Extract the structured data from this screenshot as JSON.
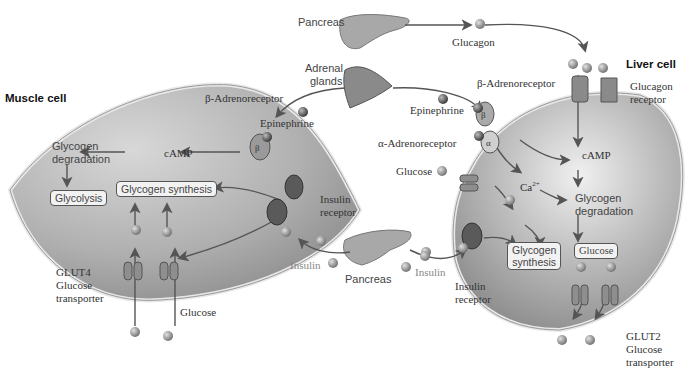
{
  "diagram": {
    "colors": {
      "cell_fill": "#9c9c9c",
      "cell_highlight": "#e6e6e6",
      "membrane": "#dcdcdc",
      "arrow": "#555555",
      "receptor_dark": "#5a5a5a",
      "molecule": "#8a8a8a",
      "transporter": "#8e8e8e"
    },
    "organs": {
      "pancreas_top": "Pancreas",
      "adrenal": "Adrenal glands",
      "pancreas_bottom": "Pancreas"
    },
    "hormones": {
      "glucagon": "Glucagon",
      "epinephrine_left": "Epinephrine",
      "epinephrine_right": "Epinephrine",
      "insulin_left": "Insulin",
      "insulin_right": "Insulin"
    },
    "muscle_cell": {
      "title": "Muscle cell",
      "beta_receptor_label": "β-Adrenoreceptor",
      "beta_symbol": "β",
      "camp": "cAMP",
      "glycogen_degradation_1": "Glycogen",
      "glycogen_degradation_2": "degradation",
      "glycolysis": "Glycolysis",
      "glycogen_synthesis": "Glycogen synthesis",
      "insulin_receptor_1": "Insulin",
      "insulin_receptor_2": "receptor",
      "glut4_1": "GLUT4",
      "glut4_2": "Glucose",
      "glut4_3": "transporter",
      "glucose": "Glucose"
    },
    "liver_cell": {
      "title": "Liver cell",
      "glucagon_receptor_1": "Glucagon",
      "glucagon_receptor_2": "receptor",
      "beta_receptor_label": "β-Adrenoreceptor",
      "beta_symbol": "β",
      "alpha_receptor_label": "α-Adrenoreceptor",
      "alpha_symbol": "α",
      "glucose_in": "Glucose",
      "camp": "cAMP",
      "calcium": "Ca",
      "calcium_sup": "2+",
      "glycogen_degradation_1": "Glycogen",
      "glycogen_degradation_2": "degradation",
      "glycogen_synthesis_1": "Glycogen",
      "glycogen_synthesis_2": "synthesis",
      "glucose_box": "Glucose",
      "insulin_receptor_1": "Insulin",
      "insulin_receptor_2": "receptor",
      "glut2_1": "GLUT2",
      "glut2_2": "Glucose",
      "glut2_3": "transporter"
    }
  }
}
